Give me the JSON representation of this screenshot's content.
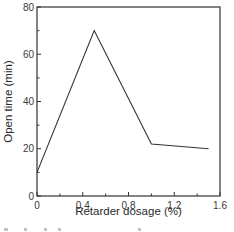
{
  "chart_data": {
    "type": "line",
    "title": "",
    "xlabel": "Retarder dosage (%)",
    "ylabel": "Open time (min)",
    "xlim": [
      0,
      1.6
    ],
    "ylim": [
      0,
      80
    ],
    "x_ticks": [
      "0",
      "0.4",
      "0.8",
      "1.2",
      "1.6"
    ],
    "y_ticks": [
      "0",
      "20",
      "40",
      "60",
      "80"
    ],
    "grid": false,
    "legend": null,
    "series": [
      {
        "name": "Open time",
        "color": "#333333",
        "x": [
          0,
          0.5,
          1.0,
          1.5
        ],
        "values": [
          10,
          70,
          22,
          20
        ]
      }
    ]
  },
  "colors": {
    "axis": "#333333",
    "line": "#333333",
    "text": "#3a3a3a",
    "background": "#ffffff"
  }
}
